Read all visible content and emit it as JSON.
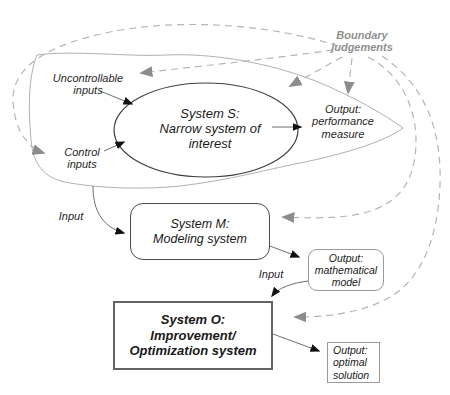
{
  "diagram": {
    "labels": {
      "boundary_judgements": "Boundary\njudgements",
      "uncontrollable_inputs": "Uncontrollable\ninputs",
      "control_inputs": "Control\ninputs",
      "output_performance": "Output:\nperformance\nmeasure",
      "input_modeling": "Input",
      "input_optimization": "Input"
    },
    "nodes": {
      "system_s": "System S:\nNarrow system of\ninterest",
      "system_m": "System M:\nModeling system",
      "system_o": "System O:\nImprovement/\nOptimization system",
      "output_mathematical": "Output:\nmathematical\nmodel",
      "output_optimal": "Output:\noptimal\nsolution"
    },
    "colors": {
      "dashed_line": "#b5b5b5",
      "gray_arrowhead": "#8c8c8c",
      "solid_line": "#6e6e6e",
      "black_arrowhead": "#111111",
      "blob_outline": "#b0b0b0",
      "ellipse_outline": "#3f3f3f",
      "boundary_text": "#8f8f8f",
      "text": "#1f1f1f"
    }
  }
}
